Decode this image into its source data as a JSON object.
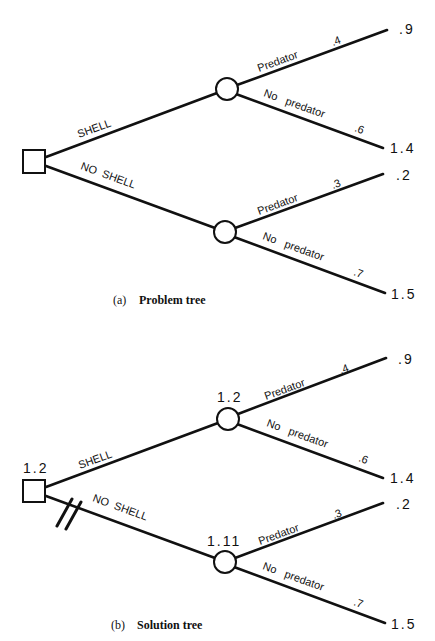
{
  "diagram": {
    "type": "decision-tree",
    "colors": {
      "ink": "#111111",
      "background": "#ffffff"
    },
    "trees": [
      {
        "id": "a",
        "caption_tag": "(a)",
        "caption": "Problem tree",
        "decision_node": {
          "value": ""
        },
        "branches": [
          {
            "label": "SHELL",
            "chance_node": {
              "value": ""
            },
            "outcomes": [
              {
                "label": "Predator",
                "probability": ".4",
                "payoff": ".9"
              },
              {
                "label": "No   predator",
                "probability": ".6",
                "payoff": "1.4"
              }
            ]
          },
          {
            "label": "NO  SHELL",
            "pruned": false,
            "chance_node": {
              "value": ""
            },
            "outcomes": [
              {
                "label": "Predator",
                "probability": ".3",
                "payoff": ".2"
              },
              {
                "label": "No   predator",
                "probability": ".7",
                "payoff": "1.5"
              }
            ]
          }
        ]
      },
      {
        "id": "b",
        "caption_tag": "(b)",
        "caption": "Solution tree",
        "decision_node": {
          "value": "1.2"
        },
        "branches": [
          {
            "label": "SHELL",
            "chance_node": {
              "value": "1.2"
            },
            "outcomes": [
              {
                "label": "Predator",
                "probability": ".4",
                "payoff": ".9"
              },
              {
                "label": "No   predator",
                "probability": ".6",
                "payoff": "1.4"
              }
            ]
          },
          {
            "label": "NO  SHELL",
            "pruned": true,
            "chance_node": {
              "value": "1.11"
            },
            "outcomes": [
              {
                "label": "Predator",
                "probability": ".3",
                "payoff": ".2"
              },
              {
                "label": "No   predator",
                "probability": ".7",
                "payoff": "1.5"
              }
            ]
          }
        ]
      }
    ]
  }
}
